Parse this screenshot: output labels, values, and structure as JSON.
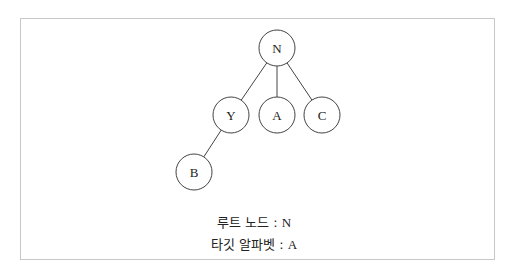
{
  "diagram": {
    "type": "tree",
    "nodes": [
      {
        "id": "N",
        "label": "N",
        "cx": 277,
        "cy": 48
      },
      {
        "id": "Y",
        "label": "Y",
        "cx": 231,
        "cy": 115
      },
      {
        "id": "A",
        "label": "A",
        "cx": 277,
        "cy": 115
      },
      {
        "id": "C",
        "label": "C",
        "cx": 322,
        "cy": 115
      },
      {
        "id": "B",
        "label": "B",
        "cx": 194,
        "cy": 172
      }
    ],
    "edges": [
      {
        "from": "N",
        "to": "Y"
      },
      {
        "from": "N",
        "to": "A"
      },
      {
        "from": "N",
        "to": "C"
      },
      {
        "from": "Y",
        "to": "B"
      }
    ],
    "node_radius": 18
  },
  "captions": {
    "root_label": "루트 노드 : ",
    "root_value": "N",
    "target_label": "타깃 알파벳 : ",
    "target_value": "A"
  },
  "colors": {
    "stroke": "#444444",
    "frame": "#c8c8c8"
  }
}
